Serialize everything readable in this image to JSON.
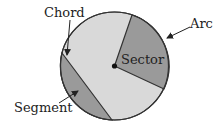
{
  "diagram": {
    "labels": {
      "chord": "Chord",
      "arc": "Arc",
      "sector": "Sector",
      "segment": "Segment"
    },
    "colors": {
      "circle_fill": "#d9d9d9",
      "shaded_fill": "#9a9a9a",
      "outline": "#333333"
    }
  }
}
